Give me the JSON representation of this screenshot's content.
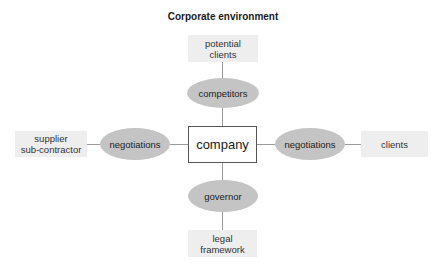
{
  "diagram": {
    "title": "Corporate environment",
    "center": {
      "label": "company"
    },
    "top": {
      "outer_line1": "potential",
      "outer_line2": "clients",
      "ellipse": "competitors"
    },
    "bottom": {
      "ellipse": "governor",
      "outer_line1": "legal",
      "outer_line2": "framework"
    },
    "left": {
      "outer_line1": "supplier",
      "outer_line2": "sub-contractor",
      "ellipse": "negotiations"
    },
    "right": {
      "ellipse": "negotiations",
      "outer": "clients"
    },
    "colors": {
      "ellipse_fill": "#c4c4c4",
      "outer_box_fill": "#eeeeee",
      "connector": "#9a9a9a",
      "company_border": "#555555"
    }
  }
}
